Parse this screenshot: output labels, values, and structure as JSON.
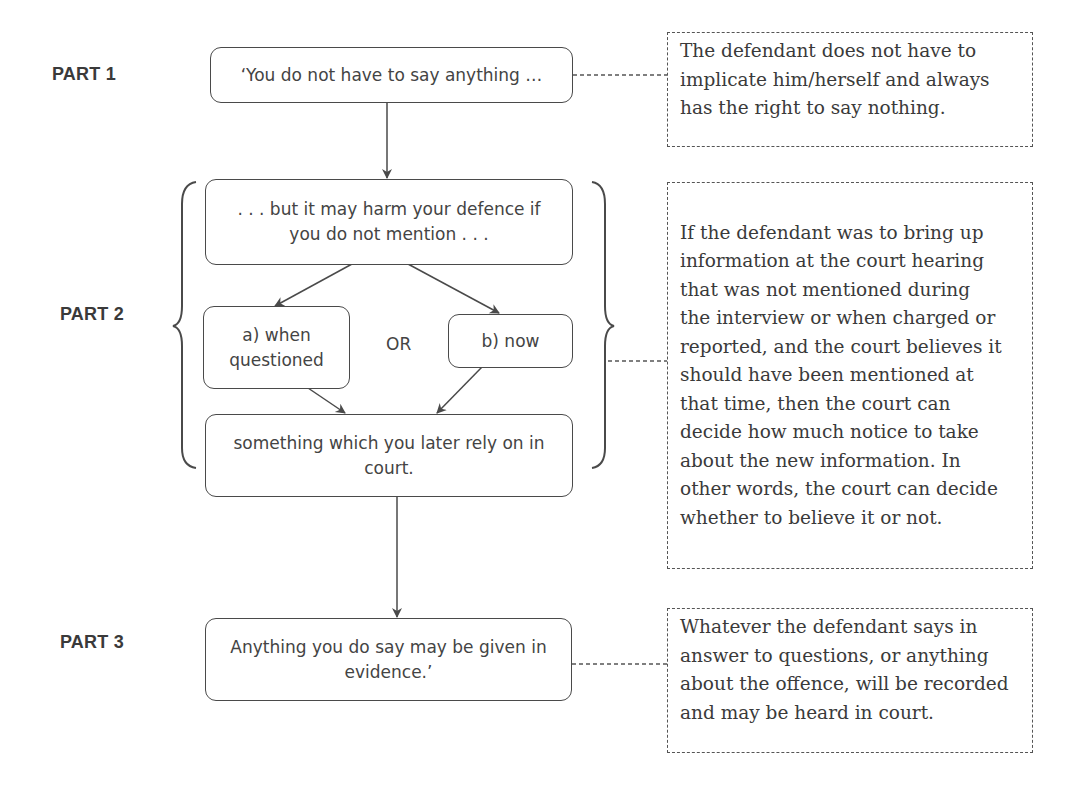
{
  "diagram": {
    "parts": [
      {
        "label": "PART 1"
      },
      {
        "label": "PART 2"
      },
      {
        "label": "PART 3"
      }
    ],
    "flow": {
      "part1_box": {
        "lines": [
          "‘You do not have to say anything …"
        ]
      },
      "part2_box_top": {
        "lines": [
          ". . . but it may harm your defence if",
          "you do not mention . . ."
        ]
      },
      "part2_option_a": {
        "lines": [
          "a) when",
          "questioned"
        ]
      },
      "part2_or": "OR",
      "part2_option_b": {
        "lines": [
          "b) now"
        ]
      },
      "part2_box_bottom": {
        "lines": [
          "something which you later rely on in",
          "court."
        ]
      },
      "part3_box": {
        "lines": [
          "Anything you do say may be given in",
          "evidence.’"
        ]
      }
    },
    "notes": [
      {
        "lines": [
          "The defendant does not have to",
          "implicate him/herself and always",
          "has the right to say nothing."
        ]
      },
      {
        "lines": [
          "If the defendant was to bring up",
          "information at the court hearing",
          "that was not mentioned during",
          "the interview or when charged or",
          "reported, and the court believes it",
          "should have been mentioned at",
          "that time, then the court can",
          "decide how much notice to take",
          "about the new information. In",
          "other words, the court can decide",
          "whether to believe it or not."
        ]
      },
      {
        "lines": [
          "Whatever the defendant says in",
          "answer to questions, or anything",
          "about the offence, will be recorded",
          "and may be heard in court."
        ]
      }
    ],
    "colors": {
      "line": "#4a4a4a",
      "text": "#3a3a3a",
      "background": "#ffffff"
    }
  }
}
